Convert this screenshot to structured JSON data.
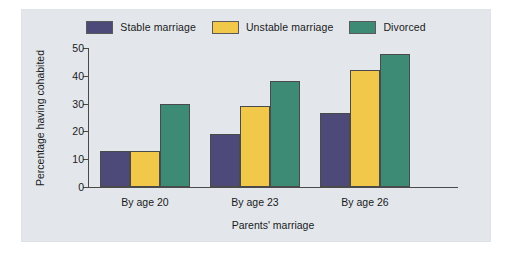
{
  "chart_data": {
    "type": "bar",
    "title": "",
    "subtitle": "",
    "xlabel": "Parents' marriage",
    "ylabel": "Percentage having cohabited",
    "categories": [
      "By age 20",
      "By age 23",
      "By age 26"
    ],
    "series": [
      {
        "name": "Stable marriage",
        "color": "#4d4a7a",
        "values": [
          13,
          19,
          26.5
        ]
      },
      {
        "name": "Unstable marriage",
        "color": "#f2c84b",
        "values": [
          13,
          29,
          42
        ]
      },
      {
        "name": "Divorced",
        "color": "#3d8a75",
        "values": [
          30,
          38,
          48
        ]
      }
    ],
    "ylim": [
      0,
      50
    ],
    "yticks": [
      0,
      10,
      20,
      30,
      40,
      50
    ],
    "ytick_labels": [
      "0",
      "10",
      "20",
      "30",
      "40",
      "50"
    ],
    "grid": false,
    "legend_position": "top-center",
    "panel_background": "#e3e7ec",
    "axis_color": "#4a4a4a",
    "bar_edge_color": "#4a4a4a"
  },
  "figure": {
    "background": "#ffffff"
  }
}
